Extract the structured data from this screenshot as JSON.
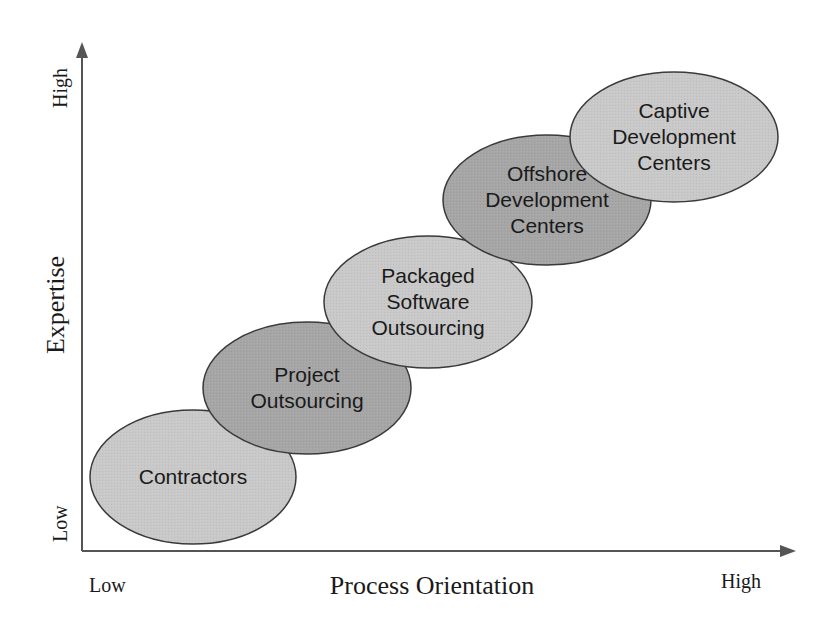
{
  "axes": {
    "x": {
      "label": "Process Orientation",
      "low": "Low",
      "high": "High"
    },
    "y": {
      "label": "Expertise",
      "low": "Low",
      "high": "High"
    }
  },
  "colors": {
    "light_fill": "#c9c9c9",
    "dark_fill": "#a6a6a6",
    "stroke": "#3a3a3a",
    "axis": "#555555"
  },
  "stages": [
    {
      "id": "contractors",
      "lines": [
        "Contractors"
      ],
      "shade": "light",
      "cx": 193,
      "cy": 477,
      "rx": 103,
      "ry": 67
    },
    {
      "id": "project-outsourcing",
      "lines": [
        "Project",
        "Outsourcing"
      ],
      "shade": "dark",
      "cx": 307,
      "cy": 388,
      "rx": 104,
      "ry": 66
    },
    {
      "id": "packaged-software-outsourcing",
      "lines": [
        "Packaged",
        "Software",
        "Outsourcing"
      ],
      "shade": "light",
      "cx": 428,
      "cy": 302,
      "rx": 104,
      "ry": 66
    },
    {
      "id": "offshore-development-centers",
      "lines": [
        "Offshore",
        "Development",
        "Centers"
      ],
      "shade": "dark",
      "cx": 547,
      "cy": 200,
      "rx": 104,
      "ry": 65
    },
    {
      "id": "captive-development-centers",
      "lines": [
        "Captive",
        "Development",
        "Centers"
      ],
      "shade": "light",
      "cx": 674,
      "cy": 137,
      "rx": 104,
      "ry": 65
    }
  ]
}
